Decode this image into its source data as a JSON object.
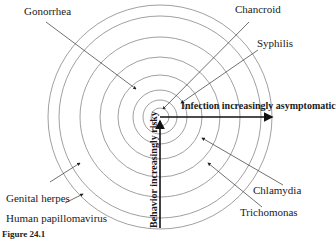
{
  "diagram": {
    "type": "concentric-rings",
    "center": {
      "x": 160,
      "y": 117
    },
    "ring_radii": [
      9,
      17,
      27,
      42,
      60,
      80,
      101,
      112
    ],
    "ring_color": "#888888",
    "axes": {
      "horizontal_label": "Infection increasingly asymptomatic",
      "vertical_label": "Behavior increasingly risky"
    },
    "labels": {
      "gonorrhea": "Gonorrhea",
      "chancroid": "Chancroid",
      "syphilis": "Syphilis",
      "genital_herpes": "Genital herpes",
      "hpv": "Human papillomavirus",
      "chlamydia": "Chlamydia",
      "trichomonas": "Trichomonas"
    },
    "caption": "Figure 24.1"
  }
}
